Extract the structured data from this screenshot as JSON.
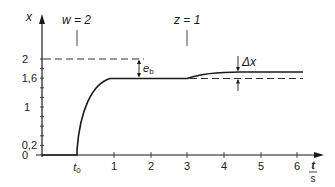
{
  "figure": {
    "type": "step-response-diagram",
    "y_axis_label": "x",
    "x_axis_label_num": "t",
    "x_axis_label_den": "s",
    "y_ticks": [
      {
        "label": "0",
        "value": 0
      },
      {
        "label": "0,2",
        "value": 0.2
      },
      {
        "label": "1",
        "value": 1
      },
      {
        "label": "1,6",
        "value": 1.6
      },
      {
        "label": "2",
        "value": 2
      }
    ],
    "x_ticks": [
      {
        "label": "t",
        "sub": "0",
        "value": 0
      },
      {
        "label": "1",
        "value": 1
      },
      {
        "label": "2",
        "value": 2
      },
      {
        "label": "3",
        "value": 3
      },
      {
        "label": "4",
        "value": 4
      },
      {
        "label": "5",
        "value": 5
      },
      {
        "label": "6",
        "value": 6
      }
    ],
    "annotations": {
      "setpoint": "w = 2",
      "disturbance": "z = 1",
      "steady_state_error": "e",
      "steady_state_error_sub": "b",
      "delta": "Δx"
    },
    "colors": {
      "line": "#1a1a1a",
      "background": "#ffffff"
    }
  }
}
